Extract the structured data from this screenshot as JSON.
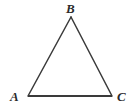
{
  "figure": {
    "kind": "geometry-diagram",
    "shape": "triangle",
    "background_color": "#ffffff",
    "stroke_color": "#3a3a3a",
    "label_color": "#2b2b2b",
    "base_stroke_width": 2,
    "side_stroke_width": 1.5
  },
  "labels": {
    "a": "A",
    "b": "B",
    "c": "C"
  },
  "vertices": {
    "a": {
      "x": 28,
      "y": 96
    },
    "b": {
      "x": 71,
      "y": 17
    },
    "c": {
      "x": 112,
      "y": 96
    }
  },
  "edges": [
    {
      "name": "AB",
      "from": "a",
      "to": "b"
    },
    {
      "name": "BC",
      "from": "b",
      "to": "c"
    },
    {
      "name": "CA",
      "from": "c",
      "to": "a"
    }
  ]
}
